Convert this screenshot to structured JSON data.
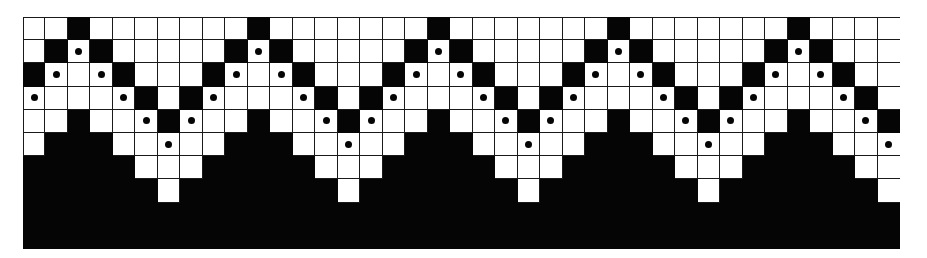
{
  "figure": {
    "type": "knitting-chart",
    "columns": 39,
    "rows": 10,
    "repeat_width": 8,
    "legend_keys": {
      "W": "background (white) stitch",
      "B": "contrast (black) stitch",
      "D": "white stitch marked with dot"
    },
    "colors": {
      "background": "#ffffff",
      "contrast": "#050505",
      "grid_line": "#1a1a1a",
      "dot": "#050505"
    },
    "repeat_pattern": [
      "WWBWWWWW",
      "WBDBWWWW",
      "BDWDBWWW",
      "DWWWDBWB",
      "WWBWWDBD",
      "WBBBWWDW",
      "BBBBBWWW",
      "BBBBBBWB",
      "BBBBBBBB",
      "BBBBBBBB"
    ],
    "grid": [
      "WWBWWWWWWWBWWWWWWWBWWWWWWWBWWWWWWWBWWWW",
      "WBDBWWWWWBDBWWWWWBDBWWWWWBDBWWWWWBDBWWW",
      "BDWDBWWWBDWDBWWWBDWDBWWWBDWDBWWWBDWDBWW",
      "DWWWDBWBDWWWDBWBDWWWDBWBDWWWDBWBDWWWDBW",
      "WWBWWDBDWWBWWDBDWWBWWDBDWWBWWDBDWWBWWDB",
      "WBBBWWDWWBBBWWDWWBBBWWDWWBBBWWDWWBBBWWD",
      "BBBBBWWWBBBBBWWWBBBBBWWWBBBBBWWWBBBBBWW",
      "BBBBBBWBBBBBBBWBBBBBBBWBBBBBBBWBBBBBBBW",
      "BBBBBBBBBBBBBBBBBBBBBBBBBBBBBBBBBBBBBBB",
      "BBBBBBBBBBBBBBBBBBBBBBBBBBBBBBBBBBBBBBB"
    ]
  }
}
